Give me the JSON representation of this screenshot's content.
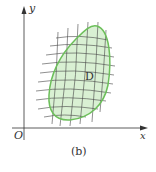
{
  "figure": {
    "caption": "(b)",
    "region_label": "D",
    "axes": {
      "x_label": "x",
      "y_label": "y",
      "origin_label": "O"
    },
    "colors": {
      "region_fill": "#d9f0d3",
      "region_stroke": "#6cbf5a",
      "grid": "#333333",
      "axis": "#333333"
    }
  }
}
